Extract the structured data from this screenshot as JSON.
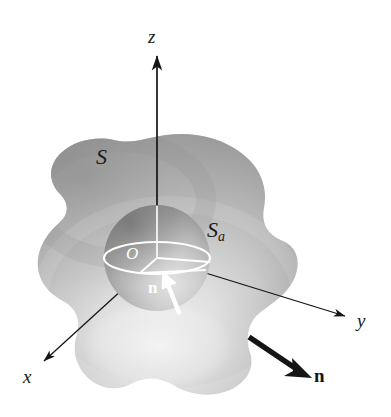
{
  "figure": {
    "background_color": "#ffffff",
    "ink_color": "#151515",
    "highlight_color": "#ffffff",
    "surface_fill_light": "#e2e2e2",
    "surface_fill_mid": "#b4b4b4",
    "surface_fill_dark": "#8f8f8f",
    "sphere_fill_light": "#d9d9d9",
    "sphere_fill_dark": "#8a8a8a"
  },
  "axes": [
    {
      "name": "z-axis",
      "label": "z",
      "direction": "up",
      "label_x": 148,
      "label_y": 27
    },
    {
      "name": "y-axis",
      "label": "y",
      "direction": "right-down",
      "label_x": 357,
      "label_y": 311
    },
    {
      "name": "x-axis",
      "label": "x",
      "direction": "left-down",
      "label_x": 23,
      "label_y": 367
    }
  ],
  "labels": {
    "outer_surface": "S",
    "inner_surface_base": "S",
    "inner_surface_sub": "a",
    "origin": "O",
    "normal_outer": "n",
    "normal_inner": "n"
  },
  "annotations": [
    {
      "name": "outer-surface-label",
      "text": "S",
      "x": 96,
      "y": 146
    },
    {
      "name": "inner-sphere-label",
      "text": "Sa",
      "x": 207,
      "y": 219
    },
    {
      "name": "origin-label",
      "text": "O",
      "x": 126,
      "y": 245
    },
    {
      "name": "inner-normal-label",
      "text": "n",
      "x": 148,
      "y": 279
    },
    {
      "name": "outer-normal-label",
      "text": "n",
      "x": 314,
      "y": 366
    }
  ]
}
